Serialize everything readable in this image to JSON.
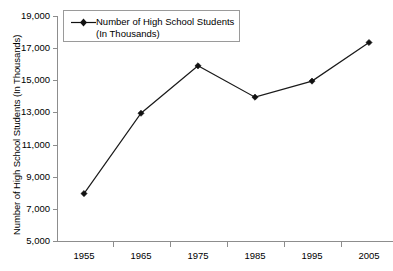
{
  "chart_data": {
    "type": "line",
    "title": "",
    "categories": [
      "1955",
      "1965",
      "1975",
      "1985",
      "1995",
      "2005"
    ],
    "series": [
      {
        "name": "Number of High School Students (In Thousands)",
        "values": [
          7950,
          12950,
          15900,
          13950,
          14950,
          17350
        ]
      }
    ],
    "xlabel": "",
    "ylabel": "Number of High School Students (In Thousands)",
    "ylim": [
      5000,
      19000
    ],
    "ytick_labels": [
      "19,000",
      "17,000",
      "15,000",
      "13,000",
      "11,000",
      "9,000",
      "7,000",
      "5,000"
    ],
    "ytick_values": [
      19000,
      17000,
      15000,
      13000,
      11000,
      9000,
      7000,
      5000
    ],
    "grid": false,
    "legend_position": "top-left",
    "marker": "diamond",
    "line_color": "#1a1a1a",
    "axis_color": "#8d8d8d",
    "background_color": "#ffffff"
  },
  "legend": {
    "line1": "Number of High School Students",
    "line2": "(In Thousands)"
  },
  "axes": {
    "y_title": "Number of High School Students (In Thousands)"
  }
}
